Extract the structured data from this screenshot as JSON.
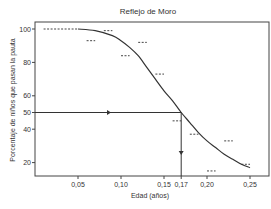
{
  "chart_data": {
    "type": "line",
    "title": "Reflejo de Moro",
    "xlabel": "Edad (años)",
    "ylabel": "Porcentaje de niños que pasan la pauta",
    "xlim": [
      0.0,
      0.27
    ],
    "ylim": [
      12,
      103
    ],
    "x_ticks": [
      {
        "value": 0.05,
        "label": "0,05"
      },
      {
        "value": 0.1,
        "label": "0,10"
      },
      {
        "value": 0.15,
        "label": "0,15"
      },
      {
        "value": 0.17,
        "label": "0,17"
      },
      {
        "value": 0.2,
        "label": "0,20"
      },
      {
        "value": 0.25,
        "label": "0,25"
      }
    ],
    "y_ticks": [
      {
        "value": 20,
        "label": "20"
      },
      {
        "value": 40,
        "label": "40"
      },
      {
        "value": 50,
        "label": "50"
      },
      {
        "value": 60,
        "label": "60"
      },
      {
        "value": 80,
        "label": "80"
      },
      {
        "value": 100,
        "label": "100"
      }
    ],
    "grid": false,
    "legend": null,
    "series": [
      {
        "name": "Curva ajustada",
        "style": "solid",
        "x": [
          0.05,
          0.07,
          0.09,
          0.1,
          0.11,
          0.12,
          0.13,
          0.14,
          0.15,
          0.16,
          0.17,
          0.18,
          0.19,
          0.2,
          0.21,
          0.22,
          0.23,
          0.24,
          0.25
        ],
        "y": [
          100,
          99,
          96,
          93,
          89,
          84,
          77,
          70,
          63,
          57,
          50,
          44,
          38,
          33,
          29,
          25,
          22,
          19,
          17
        ]
      },
      {
        "name": "Datos observados",
        "style": "dashed-markers",
        "points": [
          {
            "x0": 0.01,
            "x1": 0.05,
            "y": 100
          },
          {
            "x0": 0.06,
            "x1": 0.07,
            "y": 93
          },
          {
            "x0": 0.08,
            "x1": 0.09,
            "y": 99
          },
          {
            "x0": 0.1,
            "x1": 0.11,
            "y": 84
          },
          {
            "x0": 0.12,
            "x1": 0.13,
            "y": 92
          },
          {
            "x0": 0.14,
            "x1": 0.15,
            "y": 73
          },
          {
            "x0": 0.16,
            "x1": 0.17,
            "y": 45
          },
          {
            "x0": 0.18,
            "x1": 0.19,
            "y": 37
          },
          {
            "x0": 0.2,
            "x1": 0.21,
            "y": 15
          },
          {
            "x0": 0.22,
            "x1": 0.23,
            "y": 33
          },
          {
            "x0": 0.24,
            "x1": 0.25,
            "y": 19
          }
        ]
      }
    ],
    "annotations": [
      {
        "type": "arrow-horizontal",
        "from": {
          "x": 0.0,
          "y": 50
        },
        "to": {
          "x": 0.17,
          "y": 50
        },
        "note": "50% line to curve"
      },
      {
        "type": "arrow-vertical",
        "from": {
          "x": 0.17,
          "y": 50
        },
        "to": {
          "x": 0.17,
          "y": 12
        },
        "note": "drop to age 0,17"
      }
    ]
  }
}
